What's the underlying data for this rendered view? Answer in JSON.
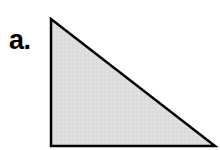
{
  "figure": {
    "label": "a.",
    "canvas": {
      "width": 220,
      "height": 150,
      "background_color": "#FFFFFF"
    },
    "shape": {
      "name": "right-triangle",
      "kind": "polygon",
      "vertices": [
        {
          "name": "apex-top-left",
          "x": 51,
          "y": 19
        },
        {
          "name": "bottom-left",
          "x": 51,
          "y": 146
        },
        {
          "name": "bottom-right",
          "x": 215,
          "y": 146
        }
      ],
      "points_attr": "51,19 51,146 215,146",
      "fill_color": "#DCDCDC",
      "stroke_color": "#000000",
      "stroke_width": 2.5,
      "edges": [
        {
          "name": "vertical-leg",
          "orientation": "vertical"
        },
        {
          "name": "horizontal-leg",
          "orientation": "horizontal"
        },
        {
          "name": "hypotenuse",
          "orientation": "diagonal"
        }
      ]
    }
  }
}
